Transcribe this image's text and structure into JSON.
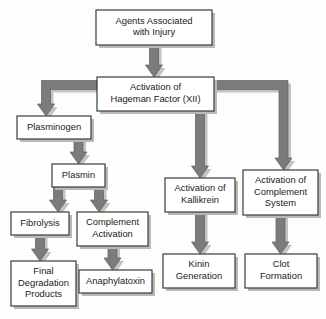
{
  "diagram": {
    "colors": {
      "box_fill": "#ffffff",
      "box_border": "#3b3b3b",
      "arrow_fill": "#7b7b7b",
      "arrow_border": "#5e5e5e",
      "shadow": "#c3c3c0",
      "background": "#fdfdfc",
      "text": "#1b1b1b"
    },
    "nodes": [
      {
        "id": "agents-associated-with-injury",
        "lines": [
          "Agents Associated",
          "with Injury"
        ],
        "x": 96,
        "y": 10,
        "w": 116,
        "h": 35
      },
      {
        "id": "activation-of-hageman-factor",
        "lines": [
          "Activation of",
          "Hageman Factor (XII)"
        ],
        "x": 97,
        "y": 77,
        "w": 117,
        "h": 34
      },
      {
        "id": "plasminogen",
        "lines": [
          "Plasminogen"
        ],
        "x": 17,
        "y": 116,
        "w": 74,
        "h": 23
      },
      {
        "id": "plasmin",
        "lines": [
          "Plasmin"
        ],
        "x": 52,
        "y": 164,
        "w": 53,
        "h": 23
      },
      {
        "id": "fibrolysis",
        "lines": [
          "Fibrolysis"
        ],
        "x": 11,
        "y": 212,
        "w": 58,
        "h": 23
      },
      {
        "id": "complement-activation",
        "lines": [
          "Complement",
          "Activation"
        ],
        "x": 77,
        "y": 212,
        "w": 71,
        "h": 34
      },
      {
        "id": "final-degradation-products",
        "lines": [
          "Final",
          "Degradation",
          "Products"
        ],
        "x": 11,
        "y": 261,
        "w": 65,
        "h": 45
      },
      {
        "id": "anaphylatoxin",
        "lines": [
          "Anaphylatoxin"
        ],
        "x": 79,
        "y": 270,
        "w": 73,
        "h": 23
      },
      {
        "id": "activation-of-kallikrein",
        "lines": [
          "Activation of",
          "Kallikrein"
        ],
        "x": 165,
        "y": 178,
        "w": 70,
        "h": 34
      },
      {
        "id": "activation-of-complement-system",
        "lines": [
          "Activation of",
          "Complement",
          "System"
        ],
        "x": 243,
        "y": 170,
        "w": 75,
        "h": 45
      },
      {
        "id": "kinin-generation",
        "lines": [
          "Kinin",
          "Generation"
        ],
        "x": 163,
        "y": 254,
        "w": 72,
        "h": 34
      },
      {
        "id": "clot-formation",
        "lines": [
          "Clot",
          "Formation"
        ],
        "x": 245,
        "y": 254,
        "w": 72,
        "h": 34
      }
    ],
    "connections": [
      {
        "id": "injury-to-hageman",
        "from": "agents-associated-with-injury",
        "to": "activation-of-hageman-factor",
        "kind": "straight-down"
      },
      {
        "id": "hageman-to-plasminogen",
        "from": "activation-of-hageman-factor",
        "to": "plasminogen",
        "kind": "left-elbow-down"
      },
      {
        "id": "plasminogen-to-plasmin",
        "from": "plasminogen",
        "to": "plasmin",
        "kind": "straight-down"
      },
      {
        "id": "plasmin-to-fibrolysis",
        "from": "plasmin",
        "to": "fibrolysis",
        "kind": "straight-down"
      },
      {
        "id": "plasmin-to-complement-activation",
        "from": "plasmin",
        "to": "complement-activation",
        "kind": "straight-down"
      },
      {
        "id": "fibrolysis-to-final-degradation-products",
        "from": "fibrolysis",
        "to": "final-degradation-products",
        "kind": "straight-down"
      },
      {
        "id": "complement-activation-to-anaphylatoxin",
        "from": "complement-activation",
        "to": "anaphylatoxin",
        "kind": "straight-down"
      },
      {
        "id": "hageman-to-kallikrein",
        "from": "activation-of-hageman-factor",
        "to": "activation-of-kallikrein",
        "kind": "straight-down"
      },
      {
        "id": "hageman-to-complement-system",
        "from": "activation-of-hageman-factor",
        "to": "activation-of-complement-system",
        "kind": "right-elbow-down"
      },
      {
        "id": "kallikrein-to-kinin-generation",
        "from": "activation-of-kallikrein",
        "to": "kinin-generation",
        "kind": "straight-down"
      },
      {
        "id": "complement-system-to-clot-formation",
        "from": "activation-of-complement-system",
        "to": "clot-formation",
        "kind": "straight-down"
      }
    ]
  }
}
